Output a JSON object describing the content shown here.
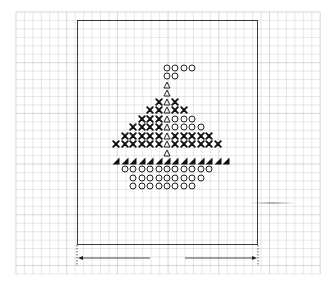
{
  "diagram": {
    "type": "cross-stitch knitting chart",
    "grid": {
      "cell_size_px": 8.45,
      "origin_x": 16,
      "origin_y": 12,
      "cols": 36,
      "rows": 31,
      "minor_color": "#dcdcdc",
      "major_color": "#c4c4c4",
      "major_every": 6
    },
    "frame": {
      "left": 77,
      "top": 20,
      "right": 258,
      "bottom": 245,
      "color": "#3a3a3a"
    },
    "symbol_grid": {
      "center_col_x": 167,
      "first_row_y": 68,
      "step": 8.45
    },
    "legend_symbols": {
      "O": "open-circle (white stitch)",
      "X": "cross (dark stitch)",
      "T": "open-triangle (mast)",
      "B": "black-right-triangle (deck edge)"
    },
    "rows": [
      {
        "row": 0,
        "cells": [
          {
            "c": 0,
            "s": "O"
          },
          {
            "c": 1,
            "s": "O"
          },
          {
            "c": 2,
            "s": "O"
          },
          {
            "c": 3,
            "s": "O"
          }
        ]
      },
      {
        "row": 1,
        "cells": [
          {
            "c": 0,
            "s": "O"
          },
          {
            "c": 1,
            "s": "O"
          }
        ]
      },
      {
        "row": 2,
        "cells": [
          {
            "c": 0,
            "s": "T"
          }
        ]
      },
      {
        "row": 3,
        "cells": [
          {
            "c": 0,
            "s": "T"
          }
        ]
      },
      {
        "row": 4,
        "cells": [
          {
            "c": -1,
            "s": "X"
          },
          {
            "c": 0,
            "s": "T"
          },
          {
            "c": 1,
            "s": "X"
          }
        ]
      },
      {
        "row": 5,
        "cells": [
          {
            "c": -2,
            "s": "X"
          },
          {
            "c": -1,
            "s": "X"
          },
          {
            "c": 0,
            "s": "T"
          },
          {
            "c": 1,
            "s": "X"
          },
          {
            "c": 2,
            "s": "X"
          }
        ]
      },
      {
        "row": 6,
        "cells": [
          {
            "c": -3,
            "s": "X"
          },
          {
            "c": -2,
            "s": "X"
          },
          {
            "c": -1,
            "s": "X"
          },
          {
            "c": 0,
            "s": "T"
          },
          {
            "c": 1,
            "s": "O"
          },
          {
            "c": 2,
            "s": "O"
          },
          {
            "c": 3,
            "s": "O"
          }
        ]
      },
      {
        "row": 7,
        "cells": [
          {
            "c": -4,
            "s": "X"
          },
          {
            "c": -3,
            "s": "X"
          },
          {
            "c": -2,
            "s": "X"
          },
          {
            "c": -1,
            "s": "X"
          },
          {
            "c": 0,
            "s": "T"
          },
          {
            "c": 1,
            "s": "O"
          },
          {
            "c": 2,
            "s": "O"
          },
          {
            "c": 3,
            "s": "O"
          },
          {
            "c": 4,
            "s": "O"
          }
        ]
      },
      {
        "row": 8,
        "cells": [
          {
            "c": -5,
            "s": "X"
          },
          {
            "c": -4,
            "s": "X"
          },
          {
            "c": -3,
            "s": "X"
          },
          {
            "c": -2,
            "s": "X"
          },
          {
            "c": -1,
            "s": "X"
          },
          {
            "c": 0,
            "s": "T"
          },
          {
            "c": 1,
            "s": "X"
          },
          {
            "c": 2,
            "s": "X"
          },
          {
            "c": 3,
            "s": "X"
          },
          {
            "c": 4,
            "s": "X"
          },
          {
            "c": 5,
            "s": "X"
          }
        ]
      },
      {
        "row": 9,
        "cells": [
          {
            "c": -6,
            "s": "X"
          },
          {
            "c": -5,
            "s": "X"
          },
          {
            "c": -4,
            "s": "X"
          },
          {
            "c": -3,
            "s": "X"
          },
          {
            "c": -2,
            "s": "X"
          },
          {
            "c": -1,
            "s": "X"
          },
          {
            "c": 0,
            "s": "T"
          },
          {
            "c": 1,
            "s": "X"
          },
          {
            "c": 2,
            "s": "X"
          },
          {
            "c": 3,
            "s": "X"
          },
          {
            "c": 4,
            "s": "X"
          },
          {
            "c": 5,
            "s": "X"
          },
          {
            "c": 6,
            "s": "X"
          }
        ]
      },
      {
        "row": 10,
        "cells": [
          {
            "c": 0,
            "s": "T"
          }
        ]
      },
      {
        "row": 11,
        "cells": [
          {
            "c": -6,
            "s": "B"
          },
          {
            "c": -5,
            "s": "B"
          },
          {
            "c": -4,
            "s": "B"
          },
          {
            "c": -3,
            "s": "B"
          },
          {
            "c": -2,
            "s": "B"
          },
          {
            "c": -1,
            "s": "B"
          },
          {
            "c": 0,
            "s": "B"
          },
          {
            "c": 1,
            "s": "B"
          },
          {
            "c": 2,
            "s": "B"
          },
          {
            "c": 3,
            "s": "B"
          },
          {
            "c": 4,
            "s": "B"
          },
          {
            "c": 5,
            "s": "B"
          },
          {
            "c": 6,
            "s": "B"
          },
          {
            "c": 7,
            "s": "B"
          }
        ]
      },
      {
        "row": 12,
        "cells": [
          {
            "c": -5,
            "s": "O"
          },
          {
            "c": -4,
            "s": "O"
          },
          {
            "c": -3,
            "s": "O"
          },
          {
            "c": -2,
            "s": "O"
          },
          {
            "c": -1,
            "s": "O"
          },
          {
            "c": 0,
            "s": "O"
          },
          {
            "c": 1,
            "s": "O"
          },
          {
            "c": 2,
            "s": "O"
          },
          {
            "c": 3,
            "s": "O"
          },
          {
            "c": 4,
            "s": "O"
          },
          {
            "c": 5,
            "s": "O"
          }
        ]
      },
      {
        "row": 13,
        "cells": [
          {
            "c": -4,
            "s": "O"
          },
          {
            "c": -3,
            "s": "O"
          },
          {
            "c": -2,
            "s": "O"
          },
          {
            "c": -1,
            "s": "O"
          },
          {
            "c": 0,
            "s": "O"
          },
          {
            "c": 1,
            "s": "O"
          },
          {
            "c": 2,
            "s": "O"
          },
          {
            "c": 3,
            "s": "O"
          },
          {
            "c": 4,
            "s": "O"
          }
        ]
      },
      {
        "row": 14,
        "cells": [
          {
            "c": -4,
            "s": "O"
          },
          {
            "c": -3,
            "s": "O"
          },
          {
            "c": -2,
            "s": "O"
          },
          {
            "c": -1,
            "s": "O"
          },
          {
            "c": 0,
            "s": "O"
          },
          {
            "c": 1,
            "s": "O"
          },
          {
            "c": 2,
            "s": "O"
          },
          {
            "c": 3,
            "s": "O"
          }
        ]
      }
    ],
    "width_dimension": {
      "y": 258,
      "left_x": 77,
      "right_x": 258,
      "gap_start_x": 150,
      "gap_end_x": 185,
      "extension_top": 245,
      "extension_bottom": 266,
      "label": ""
    },
    "scan_artifact": {
      "x": 250,
      "y": 202,
      "width": 45
    },
    "footer_caption": ""
  }
}
